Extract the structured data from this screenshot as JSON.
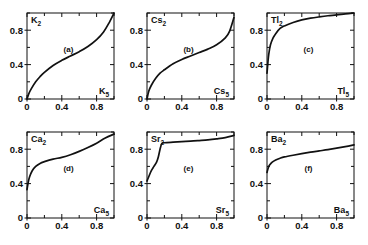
{
  "figure": {
    "background": "#ffffff",
    "ink": "#111111",
    "panel_count": 6,
    "layout": "2 rows x 3 columns"
  },
  "axes": {
    "xlim": [
      0,
      1
    ],
    "ylim": [
      0,
      1
    ],
    "major_ticks": [
      0,
      0.4,
      0.8
    ],
    "minor_ticks": [
      0.2,
      0.6,
      1.0
    ],
    "tick_labels": [
      "0",
      "0.4",
      "0.8"
    ],
    "grid": false
  },
  "chart_data": [
    {
      "type": "line",
      "tag": "(a)",
      "title": "",
      "xlabel": "K5",
      "ylabel": "K2",
      "xlabel_text": "K",
      "xlabel_sub": "5",
      "ylabel_text": "K",
      "ylabel_sub": "2",
      "xlim": [
        0,
        1
      ],
      "ylim": [
        0,
        1
      ],
      "grid": false,
      "x": [
        0,
        0.02,
        0.05,
        0.1,
        0.15,
        0.2,
        0.3,
        0.4,
        0.5,
        0.6,
        0.7,
        0.8,
        0.88,
        0.94,
        1.0
      ],
      "y": [
        0,
        0.06,
        0.12,
        0.2,
        0.26,
        0.31,
        0.39,
        0.45,
        0.5,
        0.55,
        0.61,
        0.69,
        0.78,
        0.88,
        1.0
      ]
    },
    {
      "type": "line",
      "tag": "(b)",
      "title": "",
      "xlabel": "Cs5",
      "ylabel": "Cs2",
      "xlabel_text": "Cs",
      "xlabel_sub": "5",
      "ylabel_text": "Cs",
      "ylabel_sub": "2",
      "xlim": [
        0,
        1
      ],
      "ylim": [
        0,
        1
      ],
      "grid": false,
      "x": [
        0,
        0.02,
        0.05,
        0.1,
        0.15,
        0.2,
        0.3,
        0.4,
        0.5,
        0.6,
        0.7,
        0.8,
        0.9,
        0.95,
        1.0
      ],
      "y": [
        0,
        0.09,
        0.16,
        0.24,
        0.3,
        0.34,
        0.41,
        0.46,
        0.5,
        0.54,
        0.58,
        0.63,
        0.71,
        0.79,
        0.95
      ]
    },
    {
      "type": "line",
      "tag": "(c)",
      "title": "",
      "xlabel": "Tl5",
      "ylabel": "Tl2",
      "xlabel_text": "Tl",
      "xlabel_sub": "5",
      "ylabel_text": "Tl",
      "ylabel_sub": "2",
      "xlim": [
        0,
        1
      ],
      "ylim": [
        0,
        1
      ],
      "grid": false,
      "x": [
        0,
        0.01,
        0.02,
        0.04,
        0.07,
        0.1,
        0.15,
        0.2,
        0.3,
        0.4,
        0.5,
        0.6,
        0.7,
        0.8,
        0.9,
        1.0
      ],
      "y": [
        0.3,
        0.42,
        0.52,
        0.63,
        0.71,
        0.76,
        0.82,
        0.85,
        0.89,
        0.92,
        0.94,
        0.955,
        0.968,
        0.978,
        0.99,
        1.0
      ]
    },
    {
      "type": "line",
      "tag": "(d)",
      "title": "",
      "xlabel": "Ca5",
      "ylabel": "Ca2",
      "xlabel_text": "Ca",
      "xlabel_sub": "5",
      "ylabel_text": "Ca",
      "ylabel_sub": "2",
      "xlim": [
        0,
        1
      ],
      "ylim": [
        0,
        1
      ],
      "grid": false,
      "x": [
        0,
        0.015,
        0.03,
        0.06,
        0.1,
        0.15,
        0.2,
        0.3,
        0.4,
        0.5,
        0.6,
        0.7,
        0.8,
        0.9,
        1.0
      ],
      "y": [
        0.33,
        0.42,
        0.48,
        0.55,
        0.6,
        0.635,
        0.655,
        0.685,
        0.705,
        0.735,
        0.775,
        0.82,
        0.87,
        0.93,
        0.975
      ]
    },
    {
      "type": "line",
      "tag": "(e)",
      "title": "",
      "xlabel": "Sr5",
      "ylabel": "Sr2",
      "xlabel_text": "Sr",
      "xlabel_sub": "5",
      "ylabel_text": "Sr",
      "ylabel_sub": "2",
      "xlim": [
        0,
        1
      ],
      "ylim": [
        0,
        1
      ],
      "grid": false,
      "x": [
        0,
        0.02,
        0.05,
        0.08,
        0.11,
        0.13,
        0.15,
        0.17,
        0.2,
        0.3,
        0.4,
        0.5,
        0.6,
        0.7,
        0.8,
        0.9,
        1.0
      ],
      "y": [
        0.43,
        0.48,
        0.55,
        0.6,
        0.65,
        0.71,
        0.8,
        0.865,
        0.875,
        0.882,
        0.888,
        0.893,
        0.9,
        0.908,
        0.92,
        0.935,
        0.96
      ]
    },
    {
      "type": "line",
      "tag": "(f)",
      "title": "",
      "xlabel": "Ba5",
      "ylabel": "Ba2",
      "xlabel_text": "Ba",
      "xlabel_sub": "5",
      "ylabel_text": "Ba",
      "ylabel_sub": "2",
      "xlim": [
        0,
        1
      ],
      "ylim": [
        0,
        1
      ],
      "grid": false,
      "x": [
        0,
        0.015,
        0.03,
        0.06,
        0.1,
        0.15,
        0.2,
        0.3,
        0.4,
        0.5,
        0.6,
        0.7,
        0.8,
        0.9,
        1.0
      ],
      "y": [
        0.53,
        0.585,
        0.615,
        0.65,
        0.675,
        0.695,
        0.71,
        0.73,
        0.748,
        0.765,
        0.78,
        0.795,
        0.812,
        0.83,
        0.85
      ]
    }
  ],
  "panel_positions": [
    {
      "left": 2,
      "top": 2
    },
    {
      "left": 122,
      "top": 2
    },
    {
      "left": 242,
      "top": 2
    },
    {
      "left": 2,
      "top": 121
    },
    {
      "left": 122,
      "top": 121
    },
    {
      "left": 242,
      "top": 121
    }
  ]
}
